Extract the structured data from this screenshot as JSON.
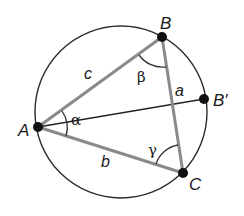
{
  "diagram": {
    "type": "inscribed-triangle",
    "colors": {
      "circle": "#2b2b2b",
      "triangle_sides": "#8a8a8a",
      "diameter_line": "#222222",
      "points": "#111111",
      "angle_arcs": "#333333",
      "background": "#ffffff"
    },
    "circle": {
      "cx": 121,
      "cy": 112,
      "r": 86
    },
    "points": [
      {
        "id": "A",
        "label": "A",
        "x": 38,
        "y": 127
      },
      {
        "id": "B",
        "label": "B",
        "x": 162,
        "y": 37
      },
      {
        "id": "C",
        "label": "C",
        "x": 183,
        "y": 173
      },
      {
        "id": "Bprime",
        "label": "B′",
        "x": 204,
        "y": 99
      }
    ],
    "sides": [
      {
        "name": "c",
        "label": "c",
        "from": "A",
        "to": "B"
      },
      {
        "name": "a",
        "label": "a",
        "from": "B",
        "to": "C"
      },
      {
        "name": "b",
        "label": "b",
        "from": "A",
        "to": "C"
      }
    ],
    "diameter": {
      "from": "A",
      "to": "Bprime"
    },
    "angles": [
      {
        "vertex": "A",
        "label": "α"
      },
      {
        "vertex": "B",
        "label": "β"
      },
      {
        "vertex": "C",
        "label": "γ"
      }
    ]
  }
}
